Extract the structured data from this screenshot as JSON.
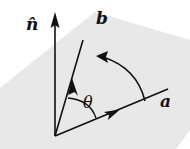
{
  "figure": {
    "colors": {
      "plane": "#e8e8e8",
      "ink": "#111111",
      "background": "#ffffff"
    },
    "labels": {
      "normal": "n̂",
      "vector_a": "a",
      "vector_b": "b",
      "angle": "θ"
    },
    "geometry": {
      "origin": [
        55,
        136
      ],
      "normal_tip": [
        55,
        14
      ],
      "b_tip": [
        82,
        42
      ],
      "a_tip": [
        166,
        90
      ]
    }
  }
}
